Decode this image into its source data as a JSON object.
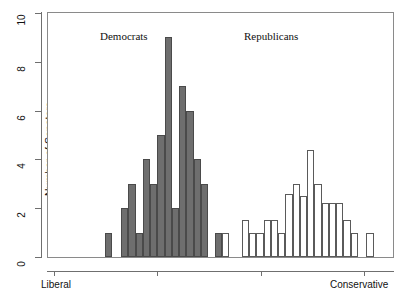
{
  "chart_data": {
    "type": "bar",
    "title": "",
    "subtitle": "",
    "xlabel": "",
    "ylabel": "Number of Senators",
    "ylim": [
      0,
      10
    ],
    "yticks": [
      0,
      2,
      4,
      6,
      8,
      10
    ],
    "ytick_labels": [
      "0",
      "2",
      "4",
      "6",
      "8",
      "10"
    ],
    "xlim": [
      0,
      100
    ],
    "xticks": [
      2,
      32,
      62,
      92
    ],
    "xtick_labels": [
      "",
      "",
      "",
      ""
    ],
    "x_axis_endpoint_labels": [
      "Liberal",
      "Conservative"
    ],
    "grid": false,
    "legend": "none",
    "annotations": [
      {
        "text": "Democrats",
        "x": 21,
        "y": 9.45
      },
      {
        "text": "Republicans",
        "x": 62,
        "y": 9.45
      }
    ],
    "series": [
      {
        "name": "Democrats",
        "color": "#6e6e6e",
        "fill": "solid",
        "bars": [
          {
            "x": 16.4,
            "width": 2.1,
            "value": 1
          },
          {
            "x": 21.2,
            "width": 2.1,
            "value": 2
          },
          {
            "x": 23.3,
            "width": 2.1,
            "value": 3
          },
          {
            "x": 25.4,
            "width": 2.1,
            "value": 1
          },
          {
            "x": 27.5,
            "width": 2.1,
            "value": 4
          },
          {
            "x": 29.6,
            "width": 2.1,
            "value": 3
          },
          {
            "x": 31.7,
            "width": 2.1,
            "value": 5
          },
          {
            "x": 33.8,
            "width": 2.1,
            "value": 9
          },
          {
            "x": 35.9,
            "width": 2.1,
            "value": 2
          },
          {
            "x": 38.0,
            "width": 2.1,
            "value": 7
          },
          {
            "x": 40.1,
            "width": 2.1,
            "value": 6
          },
          {
            "x": 42.2,
            "width": 2.1,
            "value": 4
          },
          {
            "x": 44.3,
            "width": 2.1,
            "value": 3
          }
        ]
      },
      {
        "name": "Republicans",
        "color": "#ffffff",
        "fill": "open",
        "bars": [
          {
            "x": 48.3,
            "width": 2.1,
            "value": 1,
            "overlap": true
          },
          {
            "x": 50.4,
            "width": 2.1,
            "value": 1
          },
          {
            "x": 56.2,
            "width": 2.1,
            "value": 1.5
          },
          {
            "x": 58.3,
            "width": 2.1,
            "value": 1
          },
          {
            "x": 60.4,
            "width": 2.1,
            "value": 1
          },
          {
            "x": 62.5,
            "width": 2.1,
            "value": 1.5
          },
          {
            "x": 64.6,
            "width": 2.1,
            "value": 1.5
          },
          {
            "x": 66.7,
            "width": 2.1,
            "value": 1
          },
          {
            "x": 68.8,
            "width": 2.1,
            "value": 2.6
          },
          {
            "x": 70.9,
            "width": 2.1,
            "value": 3
          },
          {
            "x": 73.0,
            "width": 2.1,
            "value": 2.5
          },
          {
            "x": 75.1,
            "width": 2.1,
            "value": 4.4
          },
          {
            "x": 77.2,
            "width": 2.1,
            "value": 3
          },
          {
            "x": 79.3,
            "width": 2.1,
            "value": 2.2
          },
          {
            "x": 81.4,
            "width": 2.1,
            "value": 2.2
          },
          {
            "x": 83.5,
            "width": 2.1,
            "value": 2.2
          },
          {
            "x": 85.6,
            "width": 2.1,
            "value": 1.5
          },
          {
            "x": 87.7,
            "width": 2.1,
            "value": 1
          },
          {
            "x": 92.3,
            "width": 2.1,
            "value": 1
          }
        ]
      }
    ]
  },
  "axes": {
    "y_title": "Number of Senators",
    "x_left_label": "Liberal",
    "x_right_label": "Conservative"
  },
  "labels": {
    "democrats": "Democrats",
    "republicans": "Republicans"
  },
  "colors": {
    "democrat_fill": "#6e6e6e",
    "democrat_stroke": "#4a4a4a",
    "republican_fill": "#ffffff",
    "republican_stroke": "#5a5a5a",
    "axis": "#6f6f6f",
    "text": "#111111"
  }
}
